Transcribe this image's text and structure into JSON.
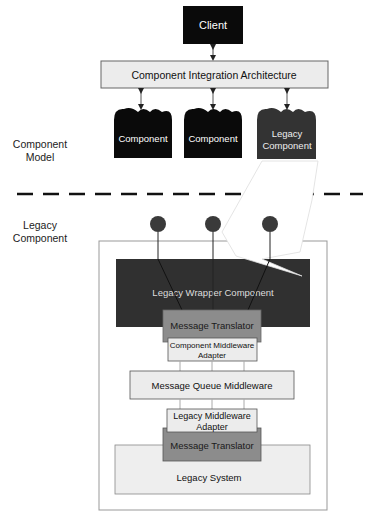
{
  "diagram": {
    "colors": {
      "black_box": "#0a0a0a",
      "legacy_component": "#333333",
      "wrapper": "#303030",
      "translator": "#8c8c8c",
      "light_box": "#ececec",
      "legacy_system": "#eeeeee",
      "line": "#222222",
      "outline": "#888888"
    },
    "nodes": {
      "client": {
        "label": "Client"
      },
      "cia": {
        "label": "Component Integration Architecture"
      },
      "component1": {
        "label": "Component"
      },
      "component2": {
        "label": "Component"
      },
      "legacy_component": {
        "line1": "Legacy",
        "line2": "Component"
      },
      "wrapper": {
        "label": "Legacy Wrapper Component"
      },
      "translator_top": {
        "label": "Message Translator"
      },
      "cma": {
        "line1": "Component Middleware",
        "line2": "Adapter"
      },
      "mqm": {
        "label": "Message Queue Middleware"
      },
      "lma": {
        "line1": "Legacy Middleware",
        "line2": "Adapter"
      },
      "translator_bottom": {
        "label": "Message Translator"
      },
      "legacy_system": {
        "label": "Legacy System"
      }
    },
    "side_labels": {
      "component_model": {
        "line1": "Component",
        "line2": "Model"
      },
      "legacy_component": {
        "line1": "Legacy",
        "line2": "Component"
      }
    },
    "interfaces": [
      "interface-1",
      "interface-2",
      "interface-3"
    ]
  }
}
